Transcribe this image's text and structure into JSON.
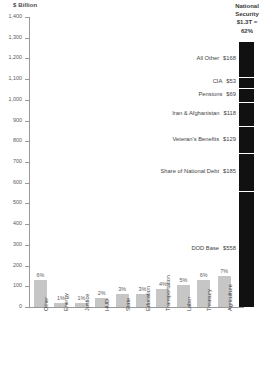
{
  "chart_data": {
    "type": "bar",
    "title": "$ Billion",
    "xlabel": "",
    "ylabel": "$ Billion",
    "ylim": [
      0,
      1400
    ],
    "ytick_step": 100,
    "grid": false,
    "legend": "none",
    "yticks": [
      "1,400",
      "1,300",
      "1,200",
      "1,100",
      "1,000",
      "900",
      "800",
      "700",
      "600",
      "500",
      "400",
      "300",
      "200",
      "100",
      "0"
    ],
    "categories": [
      "Other",
      "Energy",
      "Justice",
      "HUD",
      "State",
      "Education",
      "Transportation",
      "Labor",
      "Treasury",
      "Agriculture"
    ],
    "values": [
      129,
      21,
      21,
      43,
      64,
      64,
      86,
      107,
      129,
      150
    ],
    "percent_labels": [
      "6%",
      "1%",
      "1%",
      "2%",
      "3%",
      "3%",
      "4%",
      "5%",
      "6%",
      "7%"
    ],
    "stacked_bar": {
      "name": "National Security",
      "header_line1": "National",
      "header_line2": "Security",
      "header_total": "$1.3T =",
      "header_percent": "62%",
      "total_value": 1340,
      "color": "#111111",
      "segments": [
        {
          "label": "All Other",
          "value_label": "$168",
          "value": 168
        },
        {
          "label": "CIA",
          "value_label": "$53",
          "value": 53
        },
        {
          "label": "Pensions",
          "value_label": "$69",
          "value": 69
        },
        {
          "label": "Iran & Afghanistan",
          "value_label": "$118",
          "value": 118
        },
        {
          "label": "Veteran's Benefits",
          "value_label": "$129",
          "value": 129
        },
        {
          "label": "Share of National Debt",
          "value_label": "$185",
          "value": 185
        },
        {
          "label": "DOD Base",
          "value_label": "$558",
          "value": 558
        }
      ]
    },
    "colors": {
      "bar": "#c6c6c6",
      "stacked_bar": "#111111",
      "axis": "#9a9a9a",
      "text": "#3f3f3f"
    }
  }
}
